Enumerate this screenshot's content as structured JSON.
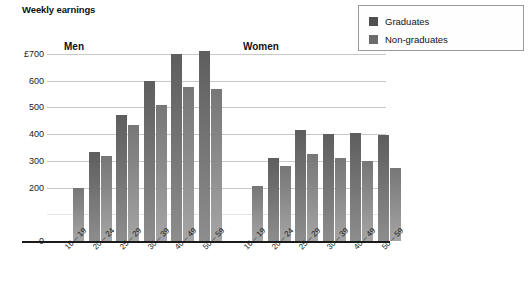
{
  "chart_data": {
    "type": "bar",
    "title": "Weekly earnings",
    "xlabel": "",
    "ylabel": "",
    "ylim": [
      0,
      700
    ],
    "yticks": [
      "0",
      "200",
      "300",
      "400",
      "500",
      "600",
      "£700"
    ],
    "ytick_values": [
      0,
      200,
      300,
      400,
      500,
      600,
      700
    ],
    "currency_symbol": "£",
    "grid": true,
    "legend_position": "top-right",
    "panels": [
      {
        "name": "Men",
        "label": "Men",
        "categories": [
          "16 – 19",
          "20 – 24",
          "25 – 29",
          "30 – 39",
          "40 – 49",
          "50 – 59"
        ],
        "series": [
          {
            "name": "Graduates",
            "values": [
              null,
              335,
              470,
              600,
              700,
              710
            ]
          },
          {
            "name": "Non-graduates",
            "values": [
              200,
              320,
              435,
              510,
              575,
              570
            ]
          }
        ]
      },
      {
        "name": "Women",
        "label": "Women",
        "categories": [
          "16 – 19",
          "20 – 24",
          "25 – 29",
          "30 – 39",
          "40 – 49",
          "50 – 59"
        ],
        "series": [
          {
            "name": "Graduates",
            "values": [
              null,
              310,
              415,
              400,
              405,
              398
            ]
          },
          {
            "name": "Non-graduates",
            "values": [
              205,
              280,
              325,
              310,
              300,
              275
            ]
          }
        ]
      }
    ],
    "legend": [
      {
        "label": "Graduates",
        "color": "#4f4f4f"
      },
      {
        "label": "Non-graduates",
        "color": "#6b6b6b"
      }
    ],
    "colors": {
      "graduates": "#4f4f4f",
      "non_graduates": "#6b6b6b",
      "gridline": "#c9c9c9",
      "axis": "#1a1a1a",
      "background": "#ffffff"
    }
  }
}
